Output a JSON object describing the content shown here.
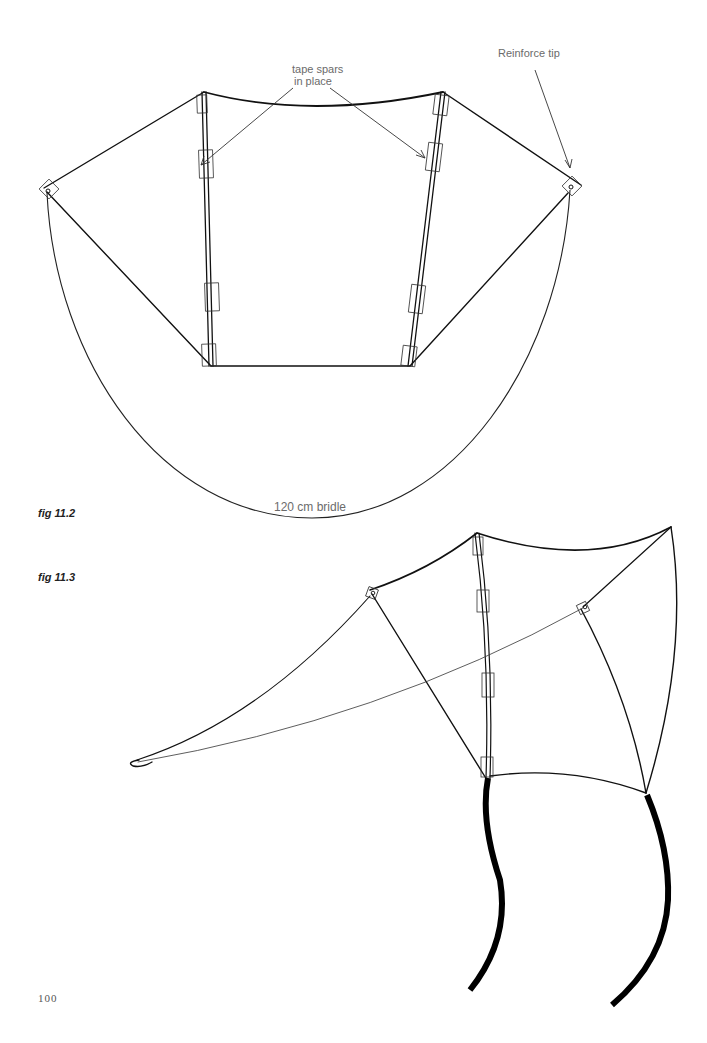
{
  "page": {
    "number": "100"
  },
  "figures": [
    {
      "id": "fig-11-2",
      "caption": "fig 11.2",
      "labels": {
        "tape_spars": [
          "tape spars",
          "in place"
        ],
        "reinforce_tip": "Reinforce tip",
        "bridle": "120 cm bridle"
      }
    },
    {
      "id": "fig-11-3",
      "caption": "fig 11.3"
    }
  ],
  "colors": {
    "ink": "#111111",
    "label": "#6b6b6b",
    "paper": "#ffffff"
  }
}
